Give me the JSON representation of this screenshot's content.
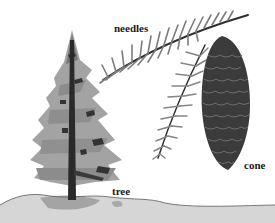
{
  "diagram": {
    "type": "labeled-illustration",
    "labels": {
      "needles": "needles",
      "cone": "cone",
      "tree": "tree"
    },
    "colors": {
      "background": "#ffffff",
      "foliage": "#9a9a9a",
      "foliage_dark": "#3a3a3a",
      "trunk": "#2a2a2a",
      "cone": "#3b3b3b",
      "cone_scale_highlight": "#6e6e6e",
      "ground": "#cfcfcf",
      "ground_dark": "#8a8a8a",
      "label_text": "#1a1a1a"
    }
  }
}
